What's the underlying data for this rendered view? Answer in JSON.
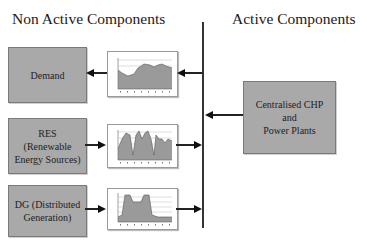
{
  "headings": {
    "left": "Non Active Components",
    "right": "Active Components"
  },
  "non_active_components": [
    {
      "label_lines": [
        "Demand"
      ],
      "flow": "from-bus",
      "profile": "demand-profile"
    },
    {
      "label_lines": [
        "RES",
        "(Renewable",
        "Energy Sources)"
      ],
      "flow": "to-bus",
      "profile": "res-profile"
    },
    {
      "label_lines": [
        "DG (Distributed",
        "Generation)"
      ],
      "flow": "to-bus",
      "profile": "dg-profile"
    }
  ],
  "active_components": [
    {
      "label_lines": [
        "Centralised CHP",
        "and",
        "Power Plants"
      ],
      "flow": "to-bus"
    }
  ],
  "colors": {
    "box_fill": "#a9a9a9",
    "chart_fill": "#9a9a9a",
    "line": "#222222"
  }
}
